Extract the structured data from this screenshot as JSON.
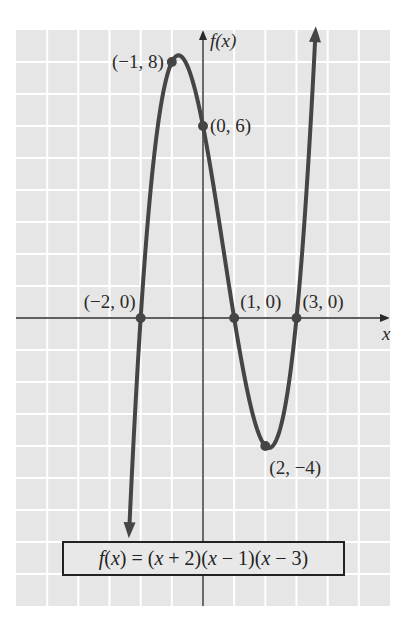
{
  "chart_data": {
    "type": "line",
    "title": "",
    "function": "f(x) = (x + 2)(x - 1)(x - 3)",
    "coefficients_descending": [
      1,
      -2,
      -5,
      6
    ],
    "xlabel": "x",
    "ylabel": "f(x)",
    "xlim": [
      -6,
      6
    ],
    "ylim": [
      -9,
      9
    ],
    "grid": true,
    "x_domain_drawn": [
      -2.37,
      3.61
    ],
    "series": [
      {
        "name": "f(x)",
        "x": [
          -2.37,
          -2,
          -1.5,
          -1,
          -0.5,
          0,
          0.5,
          1,
          1.5,
          2,
          2.5,
          3,
          3.61
        ],
        "y": [
          -6.75,
          0,
          6.875,
          8,
          7.875,
          6,
          3.125,
          0,
          -2.625,
          -4,
          -3.375,
          0,
          8.87
        ]
      }
    ],
    "points": [
      {
        "x": -1,
        "y": 8,
        "label": "(−1, 8)",
        "anchor": "left"
      },
      {
        "x": 0,
        "y": 6,
        "label": "(0, 6)",
        "anchor": "right"
      },
      {
        "x": -2,
        "y": 0,
        "label": "(−2, 0)",
        "anchor": "above-left"
      },
      {
        "x": 1,
        "y": 0,
        "label": "(1, 0)",
        "anchor": "above-right"
      },
      {
        "x": 3,
        "y": 0,
        "label": "(3, 0)",
        "anchor": "above-right"
      },
      {
        "x": 2,
        "y": -4,
        "label": "(2, −4)",
        "anchor": "below-right"
      }
    ],
    "colors": {
      "grid_background": "#e6e6e6",
      "grid_lines": "#ffffff",
      "curve": "#454545",
      "axes": "#2a2a2a"
    }
  },
  "labels": {
    "y_axis": "f(x)",
    "x_axis": "x",
    "formula_parts": {
      "f": "f",
      "open": "(",
      "x1": "x",
      "rest1": ") = (",
      "x2": "x",
      "rest2": " + 2)(",
      "x3": "x",
      "rest3": " − 1)(",
      "x4": "x",
      "rest4": " − 3)"
    }
  }
}
